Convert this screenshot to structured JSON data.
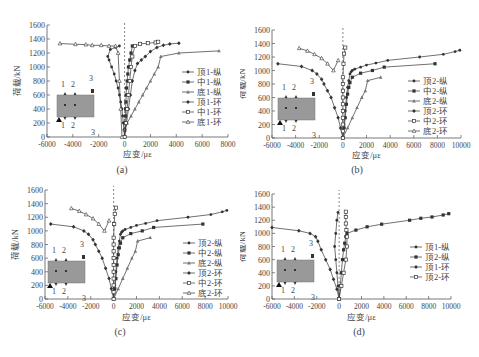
{
  "chart_data": [
    {
      "id": "a",
      "type": "line",
      "caption": "(a)",
      "xlabel": "应变/με",
      "ylabel": "荷载/kN",
      "xlim": [
        -6000,
        8000
      ],
      "ylim": [
        0,
        1600
      ],
      "xticks": [
        -6000,
        -4000,
        -2000,
        0,
        2000,
        4000,
        6000,
        8000
      ],
      "yticks": [
        0,
        200,
        400,
        600,
        800,
        1000,
        1200,
        1400,
        1600
      ],
      "grid": false,
      "legend_position": "right",
      "inset_labels": [
        "1",
        "2",
        "3",
        "1",
        "2",
        "3"
      ],
      "series": [
        {
          "name": "顶1-纵",
          "marker": "dot",
          "x": [
            0,
            -50,
            -100,
            -150,
            -200,
            -300,
            -400,
            -500,
            -650,
            -800,
            -1000,
            -1200,
            -1300,
            -1100,
            -700,
            -400
          ],
          "y": [
            0,
            100,
            200,
            300,
            400,
            500,
            600,
            700,
            800,
            900,
            1000,
            1100,
            1150,
            1250,
            1280,
            1300
          ]
        },
        {
          "name": "中1-纵",
          "marker": "square-filled",
          "x": [
            0,
            20,
            40,
            60,
            80,
            100,
            120,
            150,
            200,
            250,
            300,
            400,
            500,
            600
          ],
          "y": [
            0,
            100,
            200,
            300,
            400,
            500,
            600,
            700,
            800,
            900,
            1000,
            1100,
            1200,
            1300
          ]
        },
        {
          "name": "底1-纵",
          "marker": "triangle",
          "x": [
            0,
            200,
            500,
            800,
            1100,
            1400,
            1700,
            2000,
            2300,
            2600,
            2800,
            4200,
            7300
          ],
          "y": [
            100,
            200,
            300,
            400,
            500,
            600,
            700,
            800,
            900,
            1000,
            1150,
            1200,
            1230
          ]
        },
        {
          "name": "顶1-环",
          "marker": "diamond",
          "x": [
            0,
            150,
            300,
            450,
            600,
            800,
            1000,
            1300,
            1600,
            2000,
            2500,
            3000,
            3500,
            4200
          ],
          "y": [
            0,
            200,
            400,
            600,
            800,
            950,
            1050,
            1100,
            1150,
            1220,
            1280,
            1310,
            1330,
            1340
          ]
        },
        {
          "name": "中1-环",
          "marker": "square-open",
          "x": [
            0,
            100,
            200,
            300,
            400,
            500,
            600,
            800,
            1200,
            1800,
            2400,
            2600
          ],
          "y": [
            0,
            200,
            400,
            600,
            800,
            1000,
            1150,
            1300,
            1330,
            1340,
            1350,
            1360
          ]
        },
        {
          "name": "底1-环",
          "marker": "triangle-open",
          "x": [
            -200,
            -300,
            -400,
            -500,
            -700,
            -1200,
            -1800,
            -2500,
            -3000,
            -3800,
            -5000
          ],
          "y": [
            0,
            400,
            800,
            1200,
            1300,
            1300,
            1310,
            1310,
            1320,
            1325,
            1335
          ]
        }
      ]
    },
    {
      "id": "b",
      "type": "line",
      "caption": "(b)",
      "xlabel": "应变/με",
      "ylabel": "荷载/kN",
      "xlim": [
        -6000,
        10000
      ],
      "ylim": [
        0,
        1600
      ],
      "xticks": [
        -6000,
        -4000,
        -2000,
        0,
        2000,
        4000,
        6000,
        8000,
        10000
      ],
      "yticks": [
        0,
        200,
        400,
        600,
        800,
        1000,
        1200,
        1400,
        1600
      ],
      "grid": false,
      "legend_position": "right",
      "inset_labels": [
        "1",
        "2",
        "3",
        "1",
        "2",
        "3"
      ],
      "series": [
        {
          "name": "顶2-纵",
          "marker": "dot",
          "x": [
            0,
            100,
            200,
            300,
            400,
            500,
            600,
            700,
            800,
            1000,
            1500,
            2000,
            2800,
            3800,
            6500,
            8500,
            9500,
            9900
          ],
          "y": [
            0,
            200,
            400,
            600,
            750,
            850,
            950,
            980,
            1000,
            1020,
            1050,
            1080,
            1110,
            1150,
            1200,
            1240,
            1280,
            1300
          ]
        },
        {
          "name": "中2-纵",
          "marker": "square-filled",
          "x": [
            0,
            100,
            200,
            300,
            400,
            500,
            600,
            800,
            1500,
            2500,
            3500,
            7800
          ],
          "y": [
            0,
            150,
            300,
            500,
            650,
            750,
            820,
            900,
            960,
            1000,
            1050,
            1100
          ]
        },
        {
          "name": "底2-纵",
          "marker": "triangle",
          "x": [
            0,
            400,
            800,
            1200,
            1600,
            1900,
            2100,
            3200
          ],
          "y": [
            0,
            150,
            300,
            450,
            600,
            700,
            850,
            900
          ]
        },
        {
          "name": "顶2-环",
          "marker": "diamond",
          "x": [
            0,
            -200,
            -400,
            -700,
            -1000,
            -1300,
            -1600,
            -1800,
            -2200,
            -2600,
            -3500,
            -5500
          ],
          "y": [
            0,
            150,
            300,
            450,
            600,
            700,
            800,
            870,
            950,
            1000,
            1060,
            1100
          ]
        },
        {
          "name": "中2-环",
          "marker": "square-open",
          "x": [
            0,
            0,
            0,
            0,
            0,
            0,
            0,
            0,
            0,
            0,
            50,
            100,
            200
          ],
          "y": [
            0,
            100,
            200,
            300,
            400,
            500,
            600,
            700,
            800,
            900,
            1100,
            1250,
            1340
          ]
        },
        {
          "name": "底2-环",
          "marker": "triangle-open",
          "x": [
            -400,
            -800,
            -1300,
            -1800,
            -2400,
            -3000,
            -3700
          ],
          "y": [
            1150,
            1000,
            1100,
            1180,
            1240,
            1290,
            1330
          ]
        }
      ]
    },
    {
      "id": "c",
      "type": "line",
      "caption": "(c)",
      "xlabel": "应变/με",
      "ylabel": "荷载/kN",
      "xlim": [
        -6000,
        10000
      ],
      "ylim": [
        0,
        1600
      ],
      "xticks": [
        -6000,
        -4000,
        -2000,
        0,
        2000,
        4000,
        6000,
        8000,
        10000
      ],
      "yticks": [
        0,
        200,
        400,
        600,
        800,
        1000,
        1200,
        1400,
        1600
      ],
      "grid": false,
      "legend_position": "right",
      "inset_labels": [
        "1",
        "2",
        "3",
        "1",
        "2",
        "3"
      ],
      "series": [
        {
          "name": "顶2-纵",
          "marker": "dot",
          "x": [
            0,
            100,
            200,
            300,
            400,
            500,
            600,
            700,
            800,
            1000,
            1500,
            2000,
            2800,
            3800,
            6500,
            8500,
            9500,
            9900
          ],
          "y": [
            0,
            200,
            400,
            600,
            750,
            850,
            950,
            980,
            1000,
            1020,
            1050,
            1080,
            1110,
            1150,
            1200,
            1240,
            1280,
            1300
          ]
        },
        {
          "name": "中2-纵",
          "marker": "square-filled",
          "x": [
            0,
            100,
            200,
            300,
            400,
            500,
            600,
            800,
            1500,
            2500,
            3500,
            7800
          ],
          "y": [
            0,
            150,
            300,
            500,
            650,
            750,
            820,
            900,
            960,
            1000,
            1050,
            1100
          ]
        },
        {
          "name": "底2-纵",
          "marker": "triangle",
          "x": [
            0,
            400,
            800,
            1200,
            1600,
            1900,
            2100,
            3200
          ],
          "y": [
            0,
            150,
            300,
            450,
            600,
            700,
            850,
            900
          ]
        },
        {
          "name": "顶2-环",
          "marker": "diamond",
          "x": [
            0,
            -200,
            -400,
            -700,
            -1000,
            -1300,
            -1600,
            -1800,
            -2200,
            -2600,
            -3500,
            -5500
          ],
          "y": [
            0,
            150,
            300,
            450,
            600,
            700,
            800,
            870,
            950,
            1000,
            1060,
            1100
          ]
        },
        {
          "name": "中2-环",
          "marker": "square-open",
          "x": [
            0,
            0,
            0,
            0,
            0,
            0,
            0,
            0,
            0,
            0,
            50,
            100,
            200
          ],
          "y": [
            0,
            100,
            200,
            300,
            400,
            500,
            600,
            700,
            800,
            900,
            1100,
            1250,
            1340
          ]
        },
        {
          "name": "底2-环",
          "marker": "triangle-open",
          "x": [
            -400,
            -800,
            -1300,
            -1800,
            -2400,
            -3000,
            -3700
          ],
          "y": [
            1150,
            1000,
            1100,
            1180,
            1240,
            1290,
            1330
          ]
        }
      ]
    },
    {
      "id": "d",
      "type": "line",
      "caption": "(d)",
      "xlabel": "应变/με",
      "ylabel": "荷载/kN",
      "xlim": [
        -6000,
        10000
      ],
      "ylim": [
        0,
        1600
      ],
      "xticks": [
        -6000,
        -4000,
        -2000,
        0,
        2000,
        4000,
        6000,
        8000,
        10000
      ],
      "yticks": [
        0,
        200,
        400,
        600,
        800,
        1000,
        1200,
        1400,
        1600
      ],
      "grid": false,
      "legend_position": "right",
      "inset_labels": [
        "1",
        "2",
        "3",
        "1",
        "2",
        "3"
      ],
      "series": [
        {
          "name": "顶1-纵",
          "marker": "dot",
          "x": [
            0,
            -100,
            -200,
            -300,
            -400,
            -300,
            -200,
            -100
          ],
          "y": [
            0,
            200,
            400,
            600,
            800,
            1000,
            1200,
            1320
          ]
        },
        {
          "name": "顶2-纵",
          "marker": "square-filled",
          "x": [
            0,
            100,
            200,
            300,
            400,
            500,
            600,
            700,
            1500,
            2500,
            3800,
            6300,
            7300,
            8300,
            9300,
            9800
          ],
          "y": [
            0,
            200,
            400,
            600,
            750,
            850,
            950,
            1000,
            1050,
            1100,
            1140,
            1200,
            1230,
            1250,
            1280,
            1300
          ]
        },
        {
          "name": "顶1-环",
          "marker": "diamond",
          "x": [
            0,
            -200,
            -500,
            -800,
            -1200,
            -1600,
            -1900,
            -2100,
            -2600,
            -3600,
            -6000
          ],
          "y": [
            0,
            150,
            300,
            450,
            600,
            750,
            880,
            950,
            1000,
            1040,
            1090
          ]
        },
        {
          "name": "顶2-环",
          "marker": "square-open",
          "x": [
            0,
            200,
            400,
            600,
            700,
            700,
            650,
            600,
            600,
            600
          ],
          "y": [
            0,
            200,
            400,
            600,
            800,
            950,
            1050,
            1150,
            1250,
            1330
          ]
        }
      ]
    }
  ]
}
